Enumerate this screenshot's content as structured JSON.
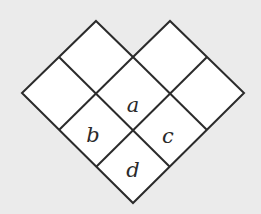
{
  "diagram": {
    "type": "heart-shaped grid of diamond cells",
    "background_color": "#ebebeb",
    "cell_fill": "#ffffff",
    "line_color": "#2b2b2b",
    "cells": [
      {
        "row": "top-left",
        "label": ""
      },
      {
        "row": "top-right",
        "label": ""
      },
      {
        "row": "left",
        "label": ""
      },
      {
        "row": "center-upper",
        "label": "a"
      },
      {
        "row": "right",
        "label": ""
      },
      {
        "row": "lower-left",
        "label": "b"
      },
      {
        "row": "lower-right",
        "label": "c"
      },
      {
        "row": "bottom",
        "label": "d"
      }
    ],
    "labels": {
      "a": "a",
      "b": "b",
      "c": "c",
      "d": "d"
    }
  }
}
